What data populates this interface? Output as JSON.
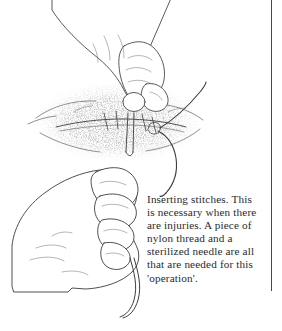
{
  "page": {
    "width": 282,
    "height": 331,
    "background_color": "#ffffff"
  },
  "illustration": {
    "title": "line drawing of two hands inserting stitches into a wound with needle and thread",
    "style": "pen-and-ink line art with stipple shading",
    "ink_color": "#3c3c3c",
    "stipple_color": "#6b6b6b",
    "elements": [
      "upper-hand-pinching-needle",
      "lower-hand-gripping-thread",
      "wound-with-stippled-shading",
      "needle",
      "thread-loop-right",
      "thread-trailing-bottom"
    ]
  },
  "caption": {
    "text": "Inserting stitches. This is necessary when there are injuries. A piece of nylon thread and a sterilized needle are all that are needed for this 'operation'.",
    "lines": [
      "Inserting stitches. This is",
      "necessary when there are",
      "injuries. A piece of nylon",
      "thread and a sterilized",
      "needle are all that are",
      "needed for this",
      "'operation'."
    ],
    "text_color": "#2b2b2b"
  },
  "rule": {
    "name": "column-divider",
    "color": "#4a4a4a",
    "orientation": "vertical"
  }
}
